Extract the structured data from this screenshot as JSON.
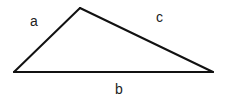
{
  "diagram": {
    "type": "triangle",
    "stroke_color": "#111111",
    "stroke_width": 2,
    "vertices": {
      "top": [
        80,
        8
      ],
      "left": [
        14,
        72
      ],
      "right": [
        213,
        72
      ]
    },
    "sides": [
      {
        "id": "a",
        "label": "a",
        "from": "left",
        "to": "top"
      },
      {
        "id": "b",
        "label": "b",
        "from": "left",
        "to": "right"
      },
      {
        "id": "c",
        "label": "c",
        "from": "top",
        "to": "right"
      }
    ]
  },
  "labels": {
    "a": "a",
    "b": "b",
    "c": "c"
  }
}
